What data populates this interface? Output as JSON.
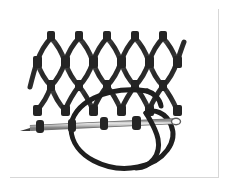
{
  "illustration": {
    "title": "Netting needle passing through knotted diamond mesh with thread loop",
    "subject": "net-repair-diagram",
    "alt_text": "Line drawing of a diamond-shaped knotted net mesh above a horizontal netting needle carrying a large loop of twine",
    "background_color": "#ffffff",
    "frame_color": "#9a9a9a",
    "frame_shadow_color": "#d7d7d7",
    "net_color": "#2b2b2b",
    "net_highlight_color": "#5a5a5a",
    "thread_color": "#1f1f1f",
    "needle_body_color": "#cfcfcf",
    "needle_edge_color": "#6f6f6f",
    "needle_point_color": "#3a3a3a"
  },
  "mesh": {
    "label": "diamond-knot-net",
    "columns": 5,
    "rows": 2,
    "top_peak_count": 5,
    "mid_knot_count": 6,
    "bottom_knot_count": 6,
    "cell_width": 29,
    "cell_height": 33,
    "origin_x": 29,
    "origin_y": 22,
    "strand_width": 5,
    "knot_width": 7,
    "knot_height": 9
  },
  "needle": {
    "label": "netting-needle",
    "x1": 20,
    "y1": 122,
    "x2": 173,
    "y2": 116,
    "thickness": 4,
    "point_side": "left",
    "eye_side": "right",
    "bead_count": 4,
    "bead_positions": [
      32,
      64,
      96,
      128
    ]
  },
  "thread": {
    "label": "twine-loop",
    "loop_center_x": 115,
    "loop_center_y": 125,
    "loop_rx": 52,
    "loop_ry": 42,
    "thickness": 5
  }
}
